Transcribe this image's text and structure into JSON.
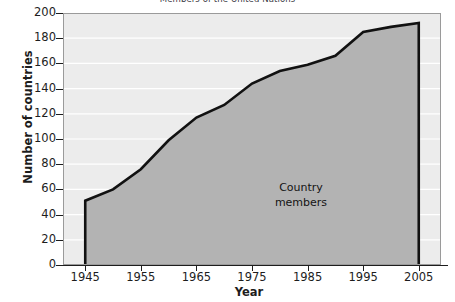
{
  "chart_data": {
    "type": "area",
    "title": "Members of the United Nations",
    "xlabel": "Year",
    "ylabel": "Number of countries",
    "x": [
      1945,
      1950,
      1955,
      1960,
      1965,
      1970,
      1975,
      1980,
      1985,
      1990,
      1995,
      2000,
      2005
    ],
    "values": [
      51,
      60,
      76,
      99,
      117,
      127,
      144,
      154,
      159,
      166,
      185,
      189,
      192
    ],
    "series": [
      {
        "name": "Country members",
        "values": [
          51,
          60,
          76,
          99,
          117,
          127,
          144,
          154,
          159,
          166,
          185,
          189,
          192
        ]
      }
    ],
    "xlim": [
      1941,
      2009
    ],
    "ylim": [
      0,
      200
    ],
    "xticks": [
      1945,
      1955,
      1965,
      1975,
      1985,
      1995,
      2005
    ],
    "xtick_labels": [
      "1945",
      "1955",
      "1965",
      "1975",
      "1985",
      "1995",
      "2005"
    ],
    "yticks": [
      0,
      20,
      40,
      60,
      80,
      100,
      120,
      140,
      160,
      180,
      200
    ],
    "ytick_labels": [
      "0",
      "20",
      "40",
      "60",
      "80",
      "100",
      "120",
      "140",
      "160",
      "180",
      "200"
    ],
    "grid": "horizontal",
    "legend": "none",
    "annotations": [
      {
        "name": "country-members-label",
        "lines": [
          "Country",
          "members"
        ],
        "x": 1972,
        "y": 75
      }
    ],
    "colors": {
      "plot_background": "#ececec",
      "area_fill": "#b3b3b3",
      "area_outline": "#111111",
      "gridline": "#ffffff",
      "axis": "#1d1d1d",
      "text": "#1d1d1d",
      "title_text": "#3a3a44",
      "page_background": "#ffffff"
    }
  }
}
